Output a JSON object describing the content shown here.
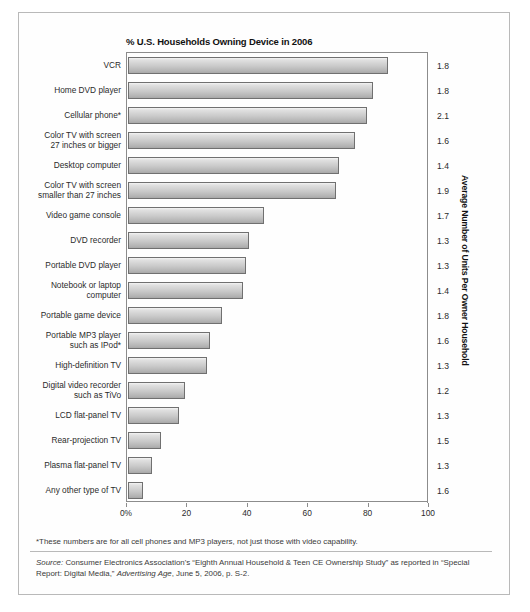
{
  "chart_data": {
    "type": "bar",
    "orientation": "horizontal",
    "title": "% U.S. Households Owning Device in 2006",
    "xlabel": "",
    "ylabel": "",
    "right_axis_title": "Average Number of Units Per Owner Household",
    "xlim": [
      0,
      100
    ],
    "xticks": [
      0,
      20,
      40,
      60,
      80,
      100
    ],
    "xtick_labels": [
      "0%",
      "20",
      "40",
      "60",
      "80",
      "100"
    ],
    "grid": false,
    "legend": "none",
    "categories": [
      "VCR",
      "Home DVD player",
      "Cellular phone*",
      "Color TV with screen\n27 inches or bigger",
      "Desktop computer",
      "Color TV with screen\nsmaller than 27 inches",
      "Video game console",
      "DVD recorder",
      "Portable DVD player",
      "Notebook or laptop\ncomputer",
      "Portable game device",
      "Portable MP3 player\nsuch as IPod*",
      "High-definition TV",
      "Digital video recorder\nsuch as TiVo",
      "LCD flat-panel TV",
      "Rear-projection TV",
      "Plasma flat-panel TV",
      "Any other type of TV"
    ],
    "values": [
      86,
      81,
      79,
      75,
      70,
      69,
      45,
      40,
      39,
      38,
      31,
      27,
      26,
      19,
      17,
      11,
      8,
      5
    ],
    "units_per_household": [
      1.8,
      1.8,
      2.1,
      1.6,
      1.4,
      1.9,
      1.7,
      1.3,
      1.3,
      1.4,
      1.8,
      1.6,
      1.3,
      1.2,
      1.3,
      1.5,
      1.3,
      1.6
    ]
  },
  "footnote": "*These numbers are for all cell phones and MP3 players, not just those with video capability.",
  "source": {
    "label": "Source:",
    "text_1": " Consumer Electronics Association's “Eighth Annual Household & Teen CE Ownership Study” as reported in “Special Report: Digital Media,” ",
    "italic_2": "Advertising Age",
    "text_3": ", June 5, 2006, p. S-2."
  }
}
